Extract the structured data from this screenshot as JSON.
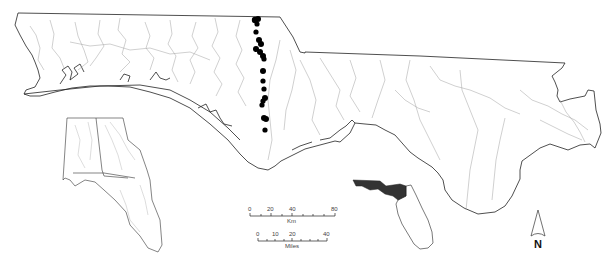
{
  "map": {
    "region": "Florida Panhandle study area",
    "colors": {
      "boundary": "#222222",
      "rivers": "#9a9a9a",
      "sites": "#000000",
      "highlight_region": "#333333",
      "background": "#ffffff"
    },
    "sample_sites": [
      [
        258,
        20
      ],
      [
        257,
        24
      ],
      [
        256,
        33
      ],
      [
        260,
        40
      ],
      [
        262,
        46
      ],
      [
        258,
        47
      ],
      [
        261,
        52
      ],
      [
        264,
        56
      ],
      [
        264,
        70
      ],
      [
        264,
        78
      ],
      [
        264,
        88
      ],
      [
        265,
        96
      ],
      [
        264,
        100
      ],
      [
        263,
        104
      ],
      [
        263,
        107
      ],
      [
        264,
        117
      ],
      [
        266,
        119
      ],
      [
        265,
        131
      ]
    ]
  },
  "scale_bar_km": {
    "ticks": [
      "0",
      "20",
      "40",
      "80"
    ],
    "unit": "Km"
  },
  "scale_bar_miles": {
    "ticks": [
      "0",
      "10",
      "20",
      "40"
    ],
    "unit": "Miles"
  },
  "north_arrow": {
    "label": "N"
  },
  "insets": {
    "locator": "Alabama, Georgia, Florida",
    "florida": "Florida with panhandle shaded"
  }
}
